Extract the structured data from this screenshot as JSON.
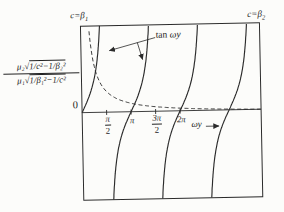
{
  "figure": {
    "background": "#fcfcfa",
    "ink": "#2b2b2b"
  },
  "labels": {
    "top_left": {
      "text": "c=β",
      "sub": "1"
    },
    "top_right": {
      "text": "c=β",
      "sub": "2"
    },
    "origin": "0",
    "tan_label": {
      "roman": "tan ",
      "italic": "ωy"
    },
    "x_axis": {
      "italic": "ωy"
    },
    "ylabel": {
      "num_pre": "μ₂√",
      "num_rad": "1/c²−1/β₂²",
      "den_pre": "μ₁√",
      "den_rad": "1/β₁²−1/c²"
    }
  },
  "chart_data": {
    "type": "line",
    "title": "",
    "xlabel": "ωy",
    "ylabel": "μ₂√(1/c²−1/β₂²) / μ₁√(1/β₁²−1/c²)",
    "x_unit": "radians",
    "x_range": [
      0,
      11.47
    ],
    "y_range": [
      -2.73,
      2.7
    ],
    "grid": false,
    "x_ticks": [
      {
        "value": 1.5708,
        "num": "π",
        "den": "2"
      },
      {
        "value": 3.1416,
        "label": "π"
      },
      {
        "value": 4.7124,
        "num": "3π",
        "den": "2"
      },
      {
        "value": 6.2832,
        "label": "2π"
      }
    ],
    "series": [
      {
        "name": "tan ωy",
        "style": "solid",
        "type": "tangent-branches",
        "branches": [
          0,
          1,
          2,
          3
        ],
        "zero_crossings": [
          "0",
          "π",
          "2π",
          "3π"
        ],
        "asymptotes": [
          "π/2",
          "3π/2",
          "5π/2",
          "7π/2"
        ]
      },
      {
        "name": "μ₂√(1/c²−1/β₂²) / μ₁√(1/β₁²−1/c²)",
        "style": "dashed",
        "type": "decay",
        "description": "decreases from +∞ at left edge (c=β₁) to 0 at right edge (c=β₂)",
        "fit": {
          "C": 0.093,
          "uL": 0.128,
          "uR": 11.73
        },
        "sample_points": [
          [
            0.56,
            2.7
          ],
          [
            0.9,
            1.3
          ],
          [
            1.8,
            0.53
          ],
          [
            2.9,
            0.25
          ],
          [
            4.4,
            0.17
          ],
          [
            6.3,
            0.1
          ],
          [
            8.5,
            0.05
          ],
          [
            11.3,
            0.01
          ]
        ]
      }
    ],
    "annotations": [
      {
        "text": "c=β₁",
        "position": "top-left"
      },
      {
        "text": "c=β₂",
        "position": "top-right"
      },
      {
        "text": "tan ωy",
        "position": "upper-middle",
        "arrows_to": [
          "branch-1",
          "branch-2"
        ]
      },
      {
        "text": "0",
        "position": "origin"
      }
    ]
  }
}
